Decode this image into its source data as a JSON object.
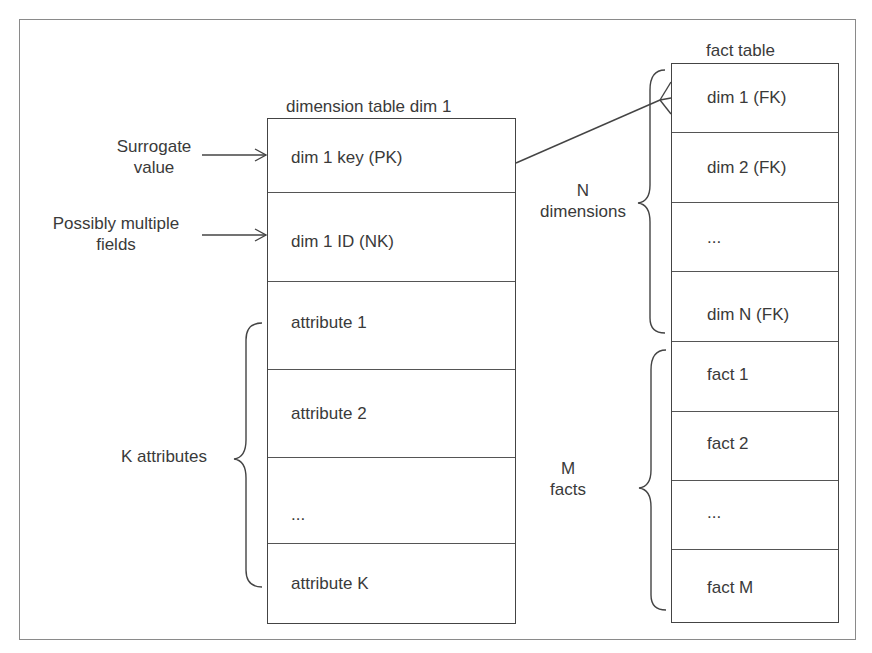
{
  "diagram": {
    "type": "star-schema",
    "dimension_table": {
      "title": "dimension table dim 1",
      "rows": [
        {
          "label": "dim 1 key (PK)"
        },
        {
          "label": "dim 1 ID (NK)"
        },
        {
          "label": "attribute 1"
        },
        {
          "label": "attribute 2"
        },
        {
          "label": "..."
        },
        {
          "label": "attribute K"
        }
      ]
    },
    "fact_table": {
      "title": "fact table",
      "rows": [
        {
          "label": "dim 1 (FK)"
        },
        {
          "label": "dim 2 (FK)"
        },
        {
          "label": "..."
        },
        {
          "label": "dim N (FK)"
        },
        {
          "label": "fact 1"
        },
        {
          "label": "fact 2"
        },
        {
          "label": "..."
        },
        {
          "label": "fact M"
        }
      ]
    },
    "annotations": {
      "surrogate_line1": "Surrogate",
      "surrogate_line2": "value",
      "multiple_line1": "Possibly multiple",
      "multiple_line2": "fields",
      "k_attributes": "K attributes",
      "n_line1": "N",
      "n_line2": "dimensions",
      "m_line1": "M",
      "m_line2": "facts"
    },
    "relationship": {
      "from": "dim 1 key (PK)",
      "to": "dim 1 (FK)",
      "cardinality": "one-to-many"
    },
    "colors": {
      "line": "#444444",
      "frame": "#8a8a8a",
      "text": "#3a3a3a"
    }
  }
}
